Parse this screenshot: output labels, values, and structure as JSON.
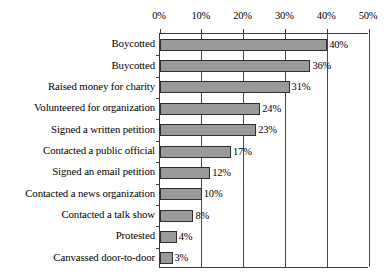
{
  "chart_data": {
    "type": "bar",
    "orientation": "horizontal",
    "title": "",
    "subtitle": "",
    "xlabel": "",
    "ylabel": "",
    "xlim": [
      0,
      50
    ],
    "xtick_labels": [
      "0%",
      "10%",
      "20%",
      "30%",
      "40%",
      "50%"
    ],
    "xticks": [
      0,
      10,
      20,
      30,
      40,
      50
    ],
    "grid": true,
    "grid_axis": "x",
    "legend": false,
    "legend_position": "none",
    "value_label_suffix": "%",
    "categories": [
      "Boycotted",
      "Buycotted",
      "Raised money for charity",
      "Volunteered for organization",
      "Signed a written petition",
      "Contacted a public official",
      "Signed an email petition",
      "Contacted a news organization",
      "Contacted a talk show",
      "Protested",
      "Canvassed door-to-door"
    ],
    "values": [
      40,
      36,
      31,
      24,
      23,
      17,
      12,
      10,
      8,
      4,
      3
    ],
    "value_labels": [
      "40%",
      "36%",
      "31%",
      "24%",
      "23%",
      "17%",
      "12%",
      "10%",
      "8%",
      "4%",
      "3%"
    ],
    "colors": {
      "bar_fill": "#9a9a9a",
      "bar_border": "#2e2e2e",
      "axis": "#3a3a3a",
      "gridline": "#4a4a4a",
      "text": "#000000",
      "background": "#ffffff"
    }
  }
}
